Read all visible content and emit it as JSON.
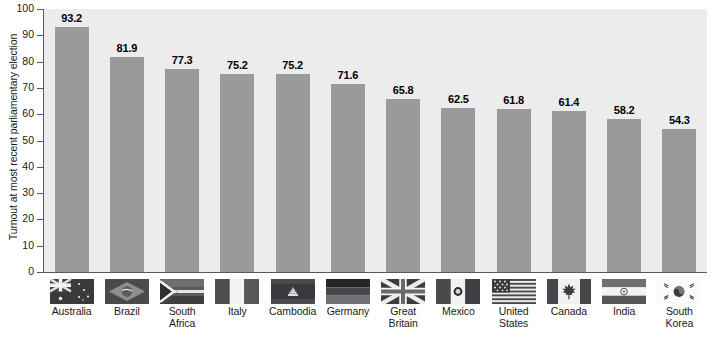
{
  "chart_data": {
    "type": "bar",
    "title": "",
    "subtitle": "",
    "xlabel": "",
    "ylabel": "Turnout at most recent parliamentary election",
    "ylim": [
      0,
      100
    ],
    "yticks": [
      0,
      10,
      20,
      30,
      40,
      50,
      60,
      70,
      80,
      90,
      100
    ],
    "grid": false,
    "legend": "none",
    "bar_color": "#9a9a9c",
    "plot_background": "#ececed",
    "axis_color": "#58585a",
    "categories": [
      "Australia",
      "Brazil",
      "South Africa",
      "Italy",
      "Cambodia",
      "Germany",
      "Great Britain",
      "Mexico",
      "United States",
      "Canada",
      "India",
      "South Korea"
    ],
    "values": [
      93.2,
      81.9,
      77.3,
      75.2,
      75.2,
      71.6,
      65.8,
      62.5,
      61.8,
      61.4,
      58.2,
      54.3
    ],
    "value_labels": [
      "93.2",
      "81.9",
      "77.3",
      "75.2",
      "75.2",
      "71.6",
      "65.8",
      "62.5",
      "61.8",
      "61.4",
      "58.2",
      "54.3"
    ]
  },
  "xaxis": {
    "items": [
      {
        "country": "Australia",
        "line1": "Australia",
        "line2": "",
        "flag": "flag-australia-icon"
      },
      {
        "country": "Brazil",
        "line1": "Brazil",
        "line2": "",
        "flag": "flag-brazil-icon"
      },
      {
        "country": "South Africa",
        "line1": "South",
        "line2": "Africa",
        "flag": "flag-south-africa-icon"
      },
      {
        "country": "Italy",
        "line1": "Italy",
        "line2": "",
        "flag": "flag-italy-icon"
      },
      {
        "country": "Cambodia",
        "line1": "Cambodia",
        "line2": "",
        "flag": "flag-cambodia-icon"
      },
      {
        "country": "Germany",
        "line1": "Germany",
        "line2": "",
        "flag": "flag-germany-icon"
      },
      {
        "country": "Great Britain",
        "line1": "Great",
        "line2": "Britain",
        "flag": "flag-great-britain-icon"
      },
      {
        "country": "Mexico",
        "line1": "Mexico",
        "line2": "",
        "flag": "flag-mexico-icon"
      },
      {
        "country": "United States",
        "line1": "United",
        "line2": "States",
        "flag": "flag-united-states-icon"
      },
      {
        "country": "Canada",
        "line1": "Canada",
        "line2": "",
        "flag": "flag-canada-icon"
      },
      {
        "country": "India",
        "line1": "India",
        "line2": "",
        "flag": "flag-india-icon"
      },
      {
        "country": "South Korea",
        "line1": "South",
        "line2": "Korea",
        "flag": "flag-south-korea-icon"
      }
    ]
  }
}
